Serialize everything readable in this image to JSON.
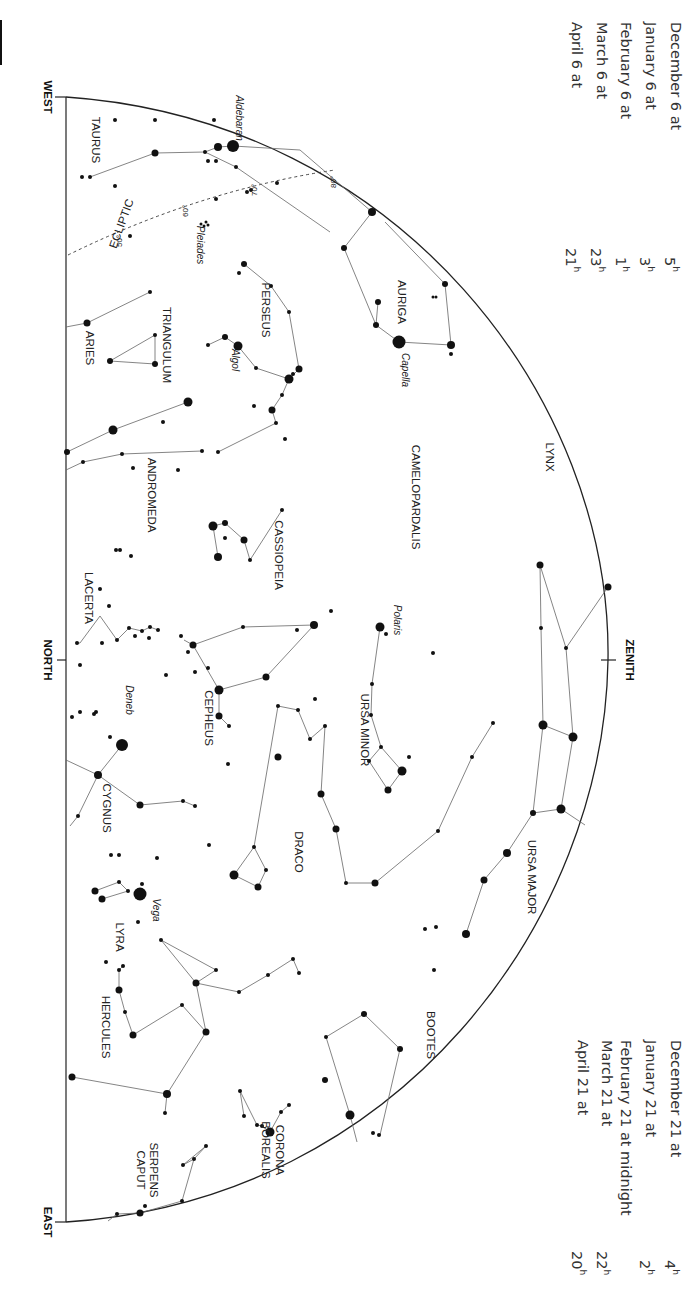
{
  "times_top": [
    {
      "date": "December 6 at",
      "hour": "5",
      "unit": "h"
    },
    {
      "date": "January 6 at",
      "hour": "3",
      "unit": "h"
    },
    {
      "date": "February 6 at",
      "hour": "1",
      "unit": "h"
    },
    {
      "date": "March 6 at",
      "hour": "23",
      "unit": "h"
    },
    {
      "date": "April 6 at",
      "hour": "21",
      "unit": "h"
    }
  ],
  "times_bottom": [
    {
      "date": "December 21 at",
      "hour": "4",
      "unit": "h"
    },
    {
      "date": "January 21 at",
      "hour": "2",
      "unit": "h"
    },
    {
      "date": "February 21 at midnight",
      "hour": "",
      "unit": ""
    },
    {
      "date": "March 21 at",
      "hour": "22",
      "unit": "h"
    },
    {
      "date": "April 21 at",
      "hour": "20",
      "unit": "h"
    }
  ],
  "cardinals": {
    "west": "WEST",
    "north": "NORTH",
    "east": "EAST",
    "zenith": "ZENITH"
  },
  "ecliptic": {
    "label": "ECLIPTIC",
    "ticks": [
      "50°",
      "60°",
      "70°",
      "80°"
    ]
  },
  "constellations": [
    {
      "name": "TAURUS",
      "x": 92,
      "y": 140
    },
    {
      "name": "AURIGA",
      "x": 398,
      "y": 302
    },
    {
      "name": "PERSEUS",
      "x": 262,
      "y": 310
    },
    {
      "name": "TRIANGULUM",
      "x": 163,
      "y": 345
    },
    {
      "name": "ARIES",
      "x": 86,
      "y": 348
    },
    {
      "name": "LYNX",
      "x": 546,
      "y": 457
    },
    {
      "name": "CAMELOPARDALIS",
      "x": 412,
      "y": 497
    },
    {
      "name": "ANDROMEDA",
      "x": 148,
      "y": 495
    },
    {
      "name": "CASSIOPEIA",
      "x": 275,
      "y": 555
    },
    {
      "name": "LACERTA",
      "x": 85,
      "y": 598
    },
    {
      "name": "URSA MINOR",
      "x": 361,
      "y": 730
    },
    {
      "name": "CEPHEUS",
      "x": 205,
      "y": 718
    },
    {
      "name": "CYGNUS",
      "x": 103,
      "y": 808
    },
    {
      "name": "DRACO",
      "x": 295,
      "y": 852
    },
    {
      "name": "URSA MAJOR",
      "x": 528,
      "y": 877
    },
    {
      "name": "LYRA",
      "x": 116,
      "y": 937
    },
    {
      "name": "HERCULES",
      "x": 102,
      "y": 1027
    },
    {
      "name": "BOOTES",
      "x": 427,
      "y": 1035
    },
    {
      "name": "CORONA",
      "x": 276,
      "y": 1150
    },
    {
      "name": "BOREALIS",
      "x": 262,
      "y": 1150
    },
    {
      "name": "SERPENS",
      "x": 150,
      "y": 1170
    },
    {
      "name": "CAPUT",
      "x": 137,
      "y": 1170
    }
  ],
  "star_names": [
    {
      "name": "Aldebaran",
      "x": 236,
      "y": 118
    },
    {
      "name": "Pleiades",
      "x": 197,
      "y": 245
    },
    {
      "name": "Capella",
      "x": 402,
      "y": 370
    },
    {
      "name": "Algol",
      "x": 232,
      "y": 360
    },
    {
      "name": "Polaris",
      "x": 394,
      "y": 620
    },
    {
      "name": "Deneb",
      "x": 126,
      "y": 700
    },
    {
      "name": "Vega",
      "x": 153,
      "y": 910
    }
  ],
  "stars": [
    [
      233,
      146,
      6
    ],
    [
      218,
      147,
      4
    ],
    [
      205,
      152,
      2
    ],
    [
      155,
      153,
      3.5
    ],
    [
      115,
      120,
      2
    ],
    [
      155,
      120,
      2
    ],
    [
      214,
      120,
      2
    ],
    [
      82,
      177,
      2
    ],
    [
      90,
      177,
      2
    ],
    [
      115,
      186,
      2
    ],
    [
      208,
      161,
      2
    ],
    [
      216,
      161,
      2
    ],
    [
      236,
      167,
      2
    ],
    [
      277,
      183,
      2
    ],
    [
      247,
      192,
      2
    ],
    [
      251,
      190,
      2
    ],
    [
      216,
      199,
      2
    ],
    [
      130,
      236,
      2
    ],
    [
      206,
      222,
      1.5
    ],
    [
      201,
      224,
      1.5
    ],
    [
      204,
      226,
      1.5
    ],
    [
      208,
      225,
      1.5
    ],
    [
      372,
      212,
      4
    ],
    [
      344,
      248,
      3
    ],
    [
      445,
      284,
      3
    ],
    [
      378,
      302,
      3
    ],
    [
      376,
      325,
      3
    ],
    [
      399,
      342,
      6.5
    ],
    [
      451,
      345,
      4
    ],
    [
      451,
      354,
      2
    ],
    [
      433,
      297,
      1.5
    ],
    [
      436,
      297,
      1.5
    ],
    [
      244,
      264,
      3
    ],
    [
      239,
      273,
      2
    ],
    [
      271,
      286,
      2
    ],
    [
      289,
      312,
      2
    ],
    [
      225,
      337,
      3
    ],
    [
      238,
      346,
      4.5
    ],
    [
      208,
      345,
      2
    ],
    [
      256,
      368,
      2
    ],
    [
      299,
      369,
      3.5
    ],
    [
      289,
      379,
      4.5
    ],
    [
      293,
      374,
      2
    ],
    [
      282,
      395,
      2
    ],
    [
      272,
      410,
      3.5
    ],
    [
      276,
      423,
      2
    ],
    [
      254,
      406,
      2
    ],
    [
      285,
      439,
      2
    ],
    [
      150,
      292,
      2
    ],
    [
      87,
      323,
      3.5
    ],
    [
      110,
      361,
      3
    ],
    [
      155,
      335,
      2
    ],
    [
      155,
      364,
      3
    ],
    [
      188,
      402,
      4.5
    ],
    [
      113,
      430,
      4.5
    ],
    [
      163,
      422,
      2
    ],
    [
      67,
      452,
      3
    ],
    [
      83,
      462,
      2
    ],
    [
      122,
      454,
      2
    ],
    [
      202,
      451,
      2
    ],
    [
      218,
      452,
      2
    ],
    [
      133,
      468,
      2
    ],
    [
      178,
      470,
      2
    ],
    [
      225,
      538,
      2
    ],
    [
      244,
      540,
      3.5
    ],
    [
      213,
      526,
      4.5
    ],
    [
      225,
      523,
      3
    ],
    [
      282,
      510,
      2
    ],
    [
      250,
      560,
      2
    ],
    [
      218,
      557,
      4
    ],
    [
      120,
      550,
      2
    ],
    [
      116,
      550,
      2
    ],
    [
      131,
      556,
      2
    ],
    [
      100,
      589,
      2
    ],
    [
      109,
      606,
      2
    ],
    [
      117,
      640,
      2
    ],
    [
      102,
      643,
      2
    ],
    [
      129,
      628,
      2
    ],
    [
      142,
      631,
      2
    ],
    [
      135,
      636,
      2
    ],
    [
      158,
      630,
      2
    ],
    [
      149,
      638,
      2
    ],
    [
      150,
      627,
      2
    ],
    [
      77,
      643,
      2
    ],
    [
      80,
      665,
      2
    ],
    [
      166,
      675,
      2
    ],
    [
      181,
      636,
      2
    ],
    [
      188,
      652,
      2
    ],
    [
      193,
      645,
      3.5
    ],
    [
      195,
      672,
      2
    ],
    [
      208,
      668,
      2
    ],
    [
      243,
      627,
      2
    ],
    [
      297,
      630,
      2
    ],
    [
      314,
      625,
      4
    ],
    [
      266,
      677,
      3.5
    ],
    [
      219,
      690,
      4.5
    ],
    [
      219,
      716,
      3.5
    ],
    [
      229,
      726,
      2
    ],
    [
      228,
      764,
      2
    ],
    [
      315,
      699,
      2
    ],
    [
      331,
      611,
      2
    ],
    [
      380,
      627,
      4.5
    ],
    [
      386,
      634,
      2
    ],
    [
      372,
      684,
      2
    ],
    [
      371,
      715,
      2
    ],
    [
      381,
      747,
      2
    ],
    [
      369,
      761,
      2
    ],
    [
      402,
      771,
      4.5
    ],
    [
      388,
      790,
      3.5
    ],
    [
      409,
      757,
      2
    ],
    [
      433,
      653,
      2
    ],
    [
      540,
      565,
      3.5
    ],
    [
      608,
      587,
      3.5
    ],
    [
      541,
      628,
      2
    ],
    [
      566,
      648,
      2
    ],
    [
      543,
      725,
      4.5
    ],
    [
      573,
      737,
      4.5
    ],
    [
      533,
      813,
      3
    ],
    [
      561,
      809,
      4.5
    ],
    [
      507,
      853,
      4
    ],
    [
      484,
      880,
      3.5
    ],
    [
      466,
      934,
      4
    ],
    [
      425,
      929,
      2
    ],
    [
      436,
      927,
      2
    ],
    [
      434,
      970,
      2
    ],
    [
      493,
      723,
      2
    ],
    [
      472,
      757,
      2
    ],
    [
      438,
      831,
      2
    ],
    [
      375,
      883,
      3.5
    ],
    [
      346,
      883,
      2
    ],
    [
      336,
      829,
      3.5
    ],
    [
      321,
      794,
      3.5
    ],
    [
      325,
      726,
      2
    ],
    [
      310,
      739,
      2
    ],
    [
      298,
      710,
      2
    ],
    [
      278,
      706,
      2
    ],
    [
      278,
      757,
      3.5
    ],
    [
      254,
      847,
      2
    ],
    [
      234,
      875,
      4.5
    ],
    [
      266,
      870,
      2
    ],
    [
      258,
      887,
      3.5
    ],
    [
      209,
      845,
      2
    ],
    [
      72,
      717,
      2
    ],
    [
      80,
      712,
      2
    ],
    [
      96,
      712,
      2
    ],
    [
      110,
      737,
      2
    ],
    [
      94,
      714,
      2
    ],
    [
      122,
      745,
      6
    ],
    [
      98,
      775,
      4
    ],
    [
      140,
      805,
      3.5
    ],
    [
      183,
      801,
      2
    ],
    [
      195,
      806,
      2
    ],
    [
      78,
      816,
      2
    ],
    [
      119,
      855,
      2
    ],
    [
      111,
      855,
      2
    ],
    [
      157,
      858,
      2
    ],
    [
      140,
      894,
      6.5
    ],
    [
      142,
      884,
      2
    ],
    [
      138,
      922,
      2
    ],
    [
      95,
      891,
      3.5
    ],
    [
      102,
      899,
      3.5
    ],
    [
      119,
      882,
      2
    ],
    [
      128,
      891,
      2
    ],
    [
      161,
      940,
      2
    ],
    [
      106,
      962,
      2
    ],
    [
      123,
      966,
      2
    ],
    [
      119,
      970,
      2
    ],
    [
      119,
      990,
      3.5
    ],
    [
      125,
      1012,
      2
    ],
    [
      133,
      1035,
      3.5
    ],
    [
      182,
      1005,
      2
    ],
    [
      196,
      983,
      3.5
    ],
    [
      216,
      970,
      2
    ],
    [
      239,
      992,
      2
    ],
    [
      268,
      975,
      2
    ],
    [
      293,
      959,
      2
    ],
    [
      299,
      973,
      2
    ],
    [
      206,
      1032,
      3.5
    ],
    [
      167,
      1094,
      4
    ],
    [
      72,
      1077,
      3.5
    ],
    [
      326,
      1037,
      2
    ],
    [
      364,
      1014,
      3
    ],
    [
      400,
      1049,
      3
    ],
    [
      325,
      1080,
      3
    ],
    [
      350,
      1115,
      4.5
    ],
    [
      373,
      1133,
      2
    ],
    [
      379,
      1135,
      2
    ],
    [
      244,
      1116,
      2
    ],
    [
      240,
      1091,
      2
    ],
    [
      257,
      1125,
      2
    ],
    [
      270,
      1132,
      4.5
    ],
    [
      262,
      1126,
      2
    ],
    [
      281,
      1112,
      2
    ],
    [
      289,
      1105,
      2
    ],
    [
      165,
      1113,
      2
    ],
    [
      206,
      1146,
      2
    ],
    [
      194,
      1159,
      2
    ],
    [
      183,
      1165,
      2
    ],
    [
      182,
      1201,
      2
    ],
    [
      145,
      1206,
      2
    ],
    [
      140,
      1213,
      3.5
    ],
    [
      117,
      1214,
      2
    ]
  ],
  "lines": [
    [
      233,
      146,
      300,
      150
    ],
    [
      300,
      150,
      372,
      212
    ],
    [
      233,
      146,
      218,
      147
    ],
    [
      218,
      147,
      205,
      152
    ],
    [
      205,
      152,
      155,
      153
    ],
    [
      155,
      153,
      90,
      177
    ],
    [
      205,
      152,
      236,
      167
    ],
    [
      236,
      167,
      330,
      232
    ],
    [
      372,
      212,
      344,
      248
    ],
    [
      344,
      248,
      376,
      325
    ],
    [
      376,
      325,
      378,
      302
    ],
    [
      376,
      325,
      399,
      342
    ],
    [
      399,
      342,
      451,
      345
    ],
    [
      451,
      345,
      445,
      284
    ],
    [
      445,
      284,
      385,
      222
    ],
    [
      244,
      264,
      271,
      286
    ],
    [
      271,
      286,
      289,
      312
    ],
    [
      289,
      312,
      299,
      369
    ],
    [
      299,
      369,
      289,
      379
    ],
    [
      289,
      379,
      256,
      368
    ],
    [
      256,
      368,
      238,
      346
    ],
    [
      238,
      346,
      225,
      337
    ],
    [
      225,
      337,
      208,
      345
    ],
    [
      289,
      379,
      282,
      395
    ],
    [
      282,
      395,
      272,
      410
    ],
    [
      272,
      410,
      276,
      423
    ],
    [
      276,
      423,
      218,
      452
    ],
    [
      150,
      292,
      87,
      323
    ],
    [
      87,
      323,
      66,
      327
    ],
    [
      110,
      361,
      155,
      335
    ],
    [
      110,
      361,
      155,
      364
    ],
    [
      155,
      335,
      155,
      364
    ],
    [
      188,
      402,
      113,
      430
    ],
    [
      113,
      430,
      67,
      452
    ],
    [
      83,
      462,
      122,
      454
    ],
    [
      122,
      454,
      202,
      451
    ],
    [
      66,
      470,
      83,
      462
    ],
    [
      244,
      540,
      225,
      523
    ],
    [
      225,
      523,
      213,
      526
    ],
    [
      213,
      526,
      218,
      557
    ],
    [
      244,
      540,
      250,
      560
    ],
    [
      250,
      560,
      282,
      510
    ],
    [
      282,
      510,
      282,
      511
    ],
    [
      77,
      643,
      80,
      643
    ],
    [
      80,
      643,
      100,
      616
    ],
    [
      100,
      616,
      117,
      640
    ],
    [
      117,
      640,
      129,
      628
    ],
    [
      129,
      628,
      142,
      631
    ],
    [
      142,
      631,
      150,
      627
    ],
    [
      150,
      627,
      158,
      630
    ],
    [
      193,
      645,
      243,
      627
    ],
    [
      243,
      627,
      314,
      625
    ],
    [
      314,
      625,
      266,
      677
    ],
    [
      266,
      677,
      219,
      690
    ],
    [
      219,
      690,
      193,
      645
    ],
    [
      193,
      645,
      184,
      640
    ],
    [
      219,
      690,
      219,
      716
    ],
    [
      219,
      716,
      229,
      726
    ],
    [
      380,
      627,
      372,
      684
    ],
    [
      372,
      684,
      371,
      715
    ],
    [
      371,
      715,
      381,
      747
    ],
    [
      381,
      747,
      402,
      771
    ],
    [
      402,
      771,
      388,
      790
    ],
    [
      388,
      790,
      369,
      761
    ],
    [
      369,
      761,
      381,
      747
    ],
    [
      540,
      565,
      541,
      628
    ],
    [
      540,
      565,
      566,
      648
    ],
    [
      566,
      648,
      608,
      587
    ],
    [
      541,
      628,
      543,
      725
    ],
    [
      566,
      648,
      573,
      737
    ],
    [
      543,
      725,
      573,
      737
    ],
    [
      543,
      725,
      533,
      813
    ],
    [
      573,
      737,
      561,
      809
    ],
    [
      533,
      813,
      561,
      809
    ],
    [
      561,
      809,
      585,
      825
    ],
    [
      533,
      813,
      507,
      853
    ],
    [
      507,
      853,
      484,
      880
    ],
    [
      484,
      880,
      466,
      934
    ],
    [
      493,
      723,
      472,
      757
    ],
    [
      472,
      757,
      438,
      831
    ],
    [
      438,
      831,
      375,
      883
    ],
    [
      375,
      883,
      346,
      883
    ],
    [
      346,
      883,
      336,
      829
    ],
    [
      336,
      829,
      321,
      794
    ],
    [
      321,
      794,
      325,
      726
    ],
    [
      325,
      726,
      310,
      739
    ],
    [
      310,
      739,
      298,
      710
    ],
    [
      298,
      710,
      278,
      706
    ],
    [
      278,
      706,
      254,
      847
    ],
    [
      254,
      847,
      234,
      875
    ],
    [
      234,
      875,
      258,
      887
    ],
    [
      258,
      887,
      266,
      870
    ],
    [
      266,
      870,
      254,
      847
    ],
    [
      122,
      745,
      98,
      775
    ],
    [
      98,
      775,
      66,
      760
    ],
    [
      98,
      775,
      140,
      805
    ],
    [
      140,
      805,
      183,
      801
    ],
    [
      183,
      801,
      195,
      806
    ],
    [
      98,
      775,
      78,
      816
    ],
    [
      78,
      816,
      70,
      826
    ],
    [
      95,
      891,
      119,
      882
    ],
    [
      119,
      882,
      128,
      891
    ],
    [
      102,
      899,
      128,
      891
    ],
    [
      119,
      970,
      123,
      966
    ],
    [
      119,
      970,
      119,
      990
    ],
    [
      119,
      990,
      125,
      1012
    ],
    [
      125,
      1012,
      133,
      1035
    ],
    [
      133,
      1035,
      182,
      1005
    ],
    [
      182,
      1005,
      206,
      1032
    ],
    [
      206,
      1032,
      196,
      983
    ],
    [
      196,
      983,
      161,
      940
    ],
    [
      161,
      940,
      216,
      970
    ],
    [
      216,
      970,
      196,
      983
    ],
    [
      196,
      983,
      239,
      992
    ],
    [
      239,
      992,
      268,
      975
    ],
    [
      268,
      975,
      293,
      959
    ],
    [
      293,
      959,
      299,
      973
    ],
    [
      206,
      1032,
      167,
      1094
    ],
    [
      167,
      1094,
      72,
      1077
    ],
    [
      167,
      1094,
      165,
      1113
    ],
    [
      326,
      1037,
      364,
      1014
    ],
    [
      364,
      1014,
      400,
      1049
    ],
    [
      400,
      1049,
      380,
      1135
    ],
    [
      326,
      1037,
      350,
      1115
    ],
    [
      350,
      1115,
      357,
      1142
    ],
    [
      244,
      1116,
      240,
      1091
    ],
    [
      240,
      1091,
      257,
      1125
    ],
    [
      257,
      1125,
      262,
      1126
    ],
    [
      262,
      1126,
      270,
      1132
    ],
    [
      270,
      1132,
      281,
      1112
    ],
    [
      281,
      1112,
      289,
      1105
    ],
    [
      206,
      1146,
      194,
      1159
    ],
    [
      194,
      1159,
      182,
      1201
    ],
    [
      182,
      1201,
      140,
      1213
    ],
    [
      140,
      1213,
      117,
      1214
    ],
    [
      117,
      1214,
      108,
      1221
    ],
    [
      206,
      1146,
      183,
      1165
    ],
    [
      183,
      1165,
      194,
      1159
    ]
  ]
}
